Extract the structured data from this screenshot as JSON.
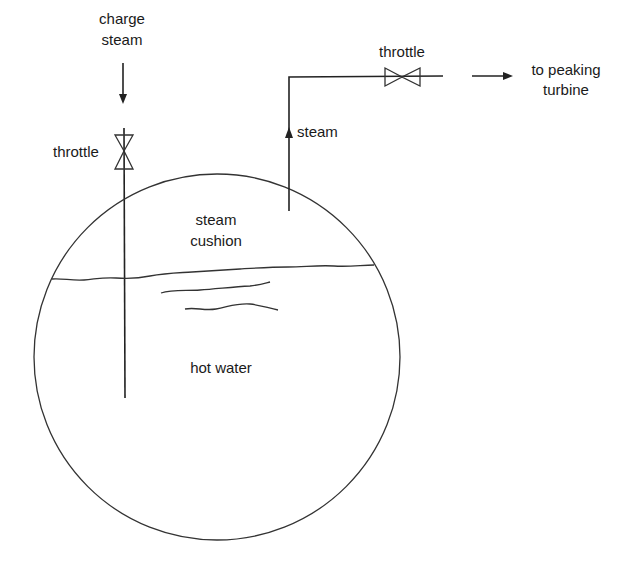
{
  "diagram": {
    "labels": {
      "charge_steam_line1": "charge",
      "charge_steam_line2": "steam",
      "inlet_throttle": "throttle",
      "outlet_throttle": "throttle",
      "outlet_steam": "steam",
      "destination_line1": "to peaking",
      "destination_line2": "turbine",
      "steam_cushion_line1": "steam",
      "steam_cushion_line2": "cushion",
      "hot_water": "hot water"
    },
    "components": [
      {
        "id": "vessel",
        "shape": "circle",
        "label": "accumulator vessel"
      },
      {
        "id": "inlet-pipe",
        "shape": "vertical-line",
        "label": "charge steam inlet"
      },
      {
        "id": "inlet-valve",
        "shape": "valve-vertical",
        "label": "throttle"
      },
      {
        "id": "outlet-pipe",
        "shape": "elbow-line",
        "label": "steam outlet"
      },
      {
        "id": "outlet-valve",
        "shape": "valve-horizontal",
        "label": "throttle"
      },
      {
        "id": "waterline",
        "shape": "wavy-line",
        "label": "water surface"
      }
    ],
    "colors": {
      "line": "#222222",
      "text": "#1a1a1a",
      "background": "#ffffff"
    }
  }
}
